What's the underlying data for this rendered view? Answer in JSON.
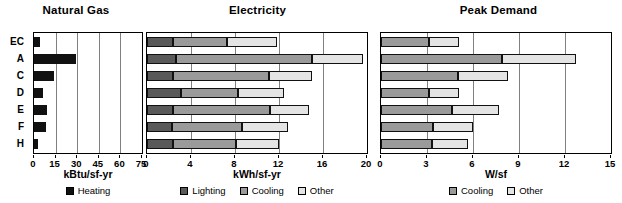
{
  "chart_data": [
    {
      "type": "bar",
      "title": "Natural Gas",
      "xlabel": "kBtu/sf-yr",
      "ylabel": "",
      "categories": [
        "EC",
        "A",
        "C",
        "D",
        "E",
        "F",
        "H"
      ],
      "xlim": [
        0,
        75
      ],
      "xticks": [
        0,
        15,
        30,
        45,
        60,
        75
      ],
      "grid": true,
      "orientation": "horizontal",
      "legend_position": "bottom",
      "series": [
        {
          "name": "Heating",
          "color": "#111111",
          "values": [
            4,
            29,
            14,
            6,
            9,
            8,
            3
          ]
        }
      ]
    },
    {
      "type": "bar",
      "title": "Electricity",
      "xlabel": "kWh/sf-yr",
      "ylabel": "",
      "categories": [
        "EC",
        "A",
        "C",
        "D",
        "E",
        "F",
        "H"
      ],
      "xlim": [
        0,
        20
      ],
      "xticks": [
        0,
        4,
        8,
        12,
        16,
        20
      ],
      "grid": true,
      "orientation": "horizontal",
      "stacked": true,
      "legend_position": "bottom",
      "series": [
        {
          "name": "Lighting",
          "color": "#595959",
          "values": [
            2.4,
            2.6,
            2.4,
            3.1,
            2.4,
            2.3,
            2.4
          ]
        },
        {
          "name": "Cooling",
          "color": "#9a9a9a",
          "values": [
            4.9,
            12.4,
            8.7,
            5.2,
            8.8,
            6.3,
            5.7
          ]
        },
        {
          "name": "Other",
          "color": "#e4e4e4",
          "values": [
            4.5,
            4.6,
            3.9,
            4.2,
            3.5,
            4.2,
            3.9
          ]
        }
      ]
    },
    {
      "type": "bar",
      "title": "Peak Demand",
      "xlabel": "W/sf",
      "ylabel": "",
      "categories": [
        "EC",
        "A",
        "C",
        "D",
        "E",
        "F",
        "H"
      ],
      "xlim": [
        0,
        15
      ],
      "xticks": [
        0,
        3,
        6,
        9,
        12,
        15
      ],
      "grid": true,
      "orientation": "horizontal",
      "stacked": true,
      "legend_position": "bottom",
      "series": [
        {
          "name": "Cooling",
          "color": "#9a9a9a",
          "values": [
            3.1,
            7.9,
            5.0,
            3.1,
            4.6,
            3.4,
            3.3
          ]
        },
        {
          "name": "Other",
          "color": "#e4e4e4",
          "values": [
            2.0,
            4.8,
            3.3,
            2.0,
            3.1,
            2.6,
            2.4
          ]
        }
      ]
    }
  ],
  "panels": [
    {
      "title": "Natural Gas",
      "axis_label": "kBtu/sf-yr"
    },
    {
      "title": "Electricity",
      "axis_label": "kWh/sf-yr"
    },
    {
      "title": "Peak Demand",
      "axis_label": "W/sf"
    }
  ],
  "legends": [
    {
      "items": [
        {
          "label": "Heating",
          "color": "#111111"
        }
      ]
    },
    {
      "items": [
        {
          "label": "Lighting",
          "color": "#595959"
        },
        {
          "label": "Cooling",
          "color": "#9a9a9a"
        },
        {
          "label": "Other",
          "color": "#e4e4e4"
        }
      ]
    },
    {
      "items": [
        {
          "label": "Cooling",
          "color": "#9a9a9a"
        },
        {
          "label": "Other",
          "color": "#e4e4e4"
        }
      ]
    }
  ]
}
